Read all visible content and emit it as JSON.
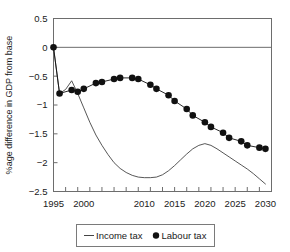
{
  "chart_data": {
    "type": "line",
    "title": "",
    "xlabel": "",
    "ylabel": "%age difference in GDP from base",
    "xlim": [
      1995,
      2031
    ],
    "ylim": [
      -2.5,
      0.5
    ],
    "grid": false,
    "zero_reference_line": true,
    "legend_position": "bottom",
    "y_ticks": [
      0.5,
      0,
      -0.5,
      -1,
      -1.5,
      -2,
      -2.5
    ],
    "y_tick_labels": [
      "0.5",
      "0",
      "−0.5",
      "−1",
      "−1.5",
      "−2",
      "−2.5"
    ],
    "x_ticks": [
      1995,
      1997,
      1999,
      2001,
      2003,
      2005,
      2007,
      2009,
      2011,
      2013,
      2015,
      2017,
      2019,
      2021,
      2023,
      2025,
      2027,
      2029
    ],
    "x_tick_labels": [
      "1995",
      "2000",
      "2010",
      "2015",
      "2020",
      "2025",
      "2030"
    ],
    "x_tick_label_values": [
      1995,
      2000,
      2010,
      2015,
      2020,
      2025,
      2030
    ],
    "series": [
      {
        "name": "Income tax",
        "style": "line",
        "color": "#444444",
        "marker": "none",
        "x": [
          1995,
          1996,
          1997,
          1998,
          1999,
          2000,
          2001,
          2002,
          2003,
          2004,
          2005,
          2006,
          2007,
          2008,
          2009,
          2010,
          2011,
          2012,
          2013,
          2014,
          2015,
          2016,
          2017,
          2018,
          2019,
          2020,
          2021,
          2022,
          2023,
          2024,
          2025,
          2026,
          2027,
          2028,
          2029,
          2030
        ],
        "values": [
          0.0,
          -0.8,
          -0.73,
          -0.58,
          -0.8,
          -1.05,
          -1.3,
          -1.52,
          -1.7,
          -1.86,
          -2.0,
          -2.1,
          -2.17,
          -2.22,
          -2.25,
          -2.26,
          -2.26,
          -2.25,
          -2.21,
          -2.14,
          -2.05,
          -1.95,
          -1.85,
          -1.76,
          -1.7,
          -1.67,
          -1.7,
          -1.76,
          -1.83,
          -1.9,
          -1.97,
          -2.04,
          -2.11,
          -2.19,
          -2.28,
          -2.37
        ]
      },
      {
        "name": "Labour tax",
        "style": "line-marker",
        "color": "#111111",
        "marker": "filled-circle",
        "x": [
          1995,
          1996,
          1998,
          1999,
          2000,
          2002,
          2003,
          2005,
          2006,
          2008,
          2009,
          2011,
          2012,
          2014,
          2015,
          2017,
          2018,
          2020,
          2021,
          2023,
          2024,
          2026,
          2027,
          2029,
          2030
        ],
        "values": [
          0.0,
          -0.8,
          -0.74,
          -0.77,
          -0.72,
          -0.62,
          -0.6,
          -0.55,
          -0.53,
          -0.53,
          -0.55,
          -0.65,
          -0.72,
          -0.83,
          -0.93,
          -1.07,
          -1.18,
          -1.3,
          -1.38,
          -1.48,
          -1.57,
          -1.63,
          -1.7,
          -1.74,
          -1.76
        ]
      }
    ]
  },
  "legend": {
    "items": [
      {
        "label": "Income tax",
        "marker": "dash"
      },
      {
        "label": "Labour tax",
        "marker": "dot"
      }
    ]
  }
}
